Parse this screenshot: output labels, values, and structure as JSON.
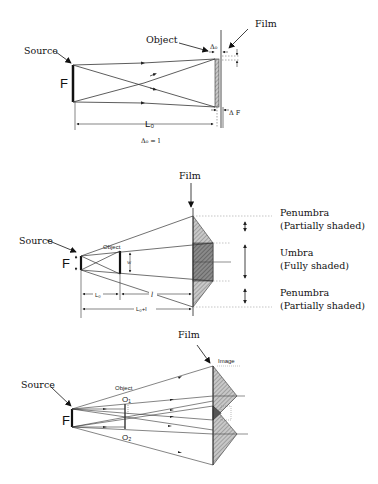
{
  "panels": [
    {
      "id": "contact-radiography",
      "labels": {
        "source": "Source",
        "object": "Object",
        "film": "Film",
        "focal_spot": "F",
        "object_film_gap": "Δ₀",
        "film_gap": "Δ F",
        "distance": "L₀",
        "equation": "Δ₀ = l"
      }
    },
    {
      "id": "penumbra-umbra",
      "labels": {
        "film": "Film",
        "source": "Source",
        "object": "Object",
        "focal_spot": "F",
        "object_width": "w",
        "source_object_distance": "L₀",
        "object_film_distance": "l",
        "total_distance": "L₀+l",
        "penumbra_top_title": "Penumbra",
        "penumbra_top_sub": "(Partially shaded)",
        "umbra_title": "Umbra",
        "umbra_sub": "(Fully shaded)",
        "penumbra_bottom_title": "Penumbra",
        "penumbra_bottom_sub": "(Partially shaded)"
      }
    },
    {
      "id": "two-point-object",
      "labels": {
        "film": "Film",
        "image": "Image",
        "source": "Source",
        "object": "Object",
        "focal_spot": "F",
        "point_1": "O₁",
        "point_2": "O₂"
      }
    }
  ],
  "colors": {
    "line": "#222222",
    "shade_light": "#b5b5b5",
    "shade_dark": "#6e6e6e",
    "background": "#ffffff"
  }
}
